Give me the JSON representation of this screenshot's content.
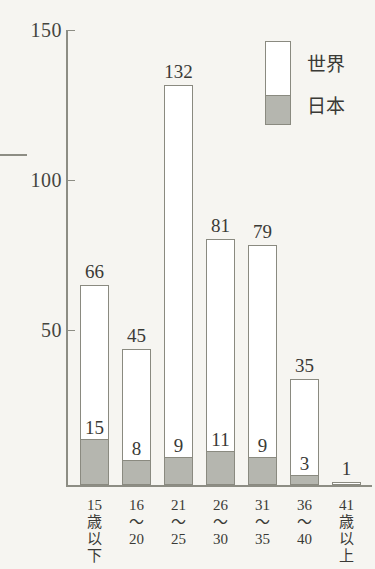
{
  "chart_data": {
    "type": "bar",
    "title": "",
    "subtitle": "",
    "xlabel": "",
    "ylabel": "",
    "ylim": [
      0,
      150
    ],
    "yticks": [
      50,
      100,
      150
    ],
    "ytick_labels": [
      "50",
      "100",
      "150"
    ],
    "grid": false,
    "stacked": true,
    "legend_position": "top-right",
    "categories": [
      "15歳以下",
      "16〜20",
      "21〜25",
      "26〜30",
      "31〜35",
      "36〜40",
      "41歳以上"
    ],
    "category_lines": [
      [
        "15",
        "歳",
        "以",
        "下"
      ],
      [
        "16",
        "〜",
        "20"
      ],
      [
        "21",
        "〜",
        "25"
      ],
      [
        "26",
        "〜",
        "30"
      ],
      [
        "31",
        "〜",
        "35"
      ],
      [
        "36",
        "〜",
        "40"
      ],
      [
        "41",
        "歳",
        "以",
        "上"
      ]
    ],
    "series": [
      {
        "name": "世界",
        "color": "#ffffff",
        "values": [
          66,
          45,
          132,
          81,
          79,
          35,
          1
        ]
      },
      {
        "name": "日本",
        "color": "#b5b6af",
        "values": [
          15,
          8,
          9,
          11,
          9,
          3,
          0
        ]
      }
    ],
    "value_labels": {
      "world": [
        "66",
        "45",
        "132",
        "81",
        "79",
        "35",
        "1"
      ],
      "japan": [
        "15",
        "8",
        "9",
        "11",
        "9",
        "3",
        ""
      ]
    }
  },
  "legend": {
    "world_label": "世界",
    "japan_label": "日本"
  },
  "axis": {
    "tick_150": "150",
    "tick_100": "100",
    "tick_50": "50"
  }
}
